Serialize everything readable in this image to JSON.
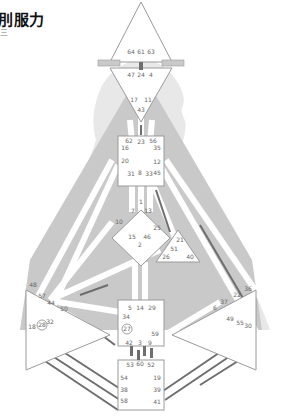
{
  "header": {
    "title": "刖服力",
    "subtitle": "三"
  },
  "colors": {
    "background": "#ffffff",
    "silhouette": "#e6e6e6",
    "body_fill": "#c9c9c9",
    "center_fill": "#ffffff",
    "center_stroke": "#9a9a9a",
    "channel_open": "#ffffff",
    "channel_defined": "#6e6e6e",
    "gate_text": "#666666"
  },
  "bodygraph": {
    "centers": [
      {
        "name": "Head",
        "gates": [
          "64",
          "61",
          "63"
        ]
      },
      {
        "name": "Ajna",
        "gates": [
          "47",
          "24",
          "4",
          "17",
          "11",
          "43"
        ]
      },
      {
        "name": "Throat",
        "gates": [
          "62",
          "23",
          "56",
          "16",
          "35",
          "20",
          "12",
          "31",
          "8",
          "33",
          "45"
        ]
      },
      {
        "name": "G",
        "gates": [
          "1",
          "7",
          "13",
          "10",
          "25",
          "15",
          "46",
          "2"
        ]
      },
      {
        "name": "Heart",
        "gates": [
          "21",
          "51",
          "26",
          "40"
        ]
      },
      {
        "name": "Spleen",
        "gates": [
          "48",
          "57",
          "44",
          "50",
          "32",
          "28",
          "18"
        ]
      },
      {
        "name": "Solar Plexus",
        "gates": [
          "36",
          "22",
          "37",
          "6",
          "49",
          "55",
          "30"
        ]
      },
      {
        "name": "Sacral",
        "gates": [
          "5",
          "14",
          "29",
          "34",
          "27",
          "59",
          "42",
          "3",
          "9"
        ]
      },
      {
        "name": "Root",
        "gates": [
          "53",
          "60",
          "52",
          "54",
          "19",
          "38",
          "39",
          "58",
          "41"
        ]
      }
    ],
    "circled_gates": [
      "27",
      "28"
    ],
    "gate_labels": {
      "g64": "64",
      "g61": "61",
      "g63": "63",
      "g47": "47",
      "g24": "24",
      "g4": "4",
      "g17": "17",
      "g11": "11",
      "g43": "43",
      "g62": "62",
      "g23": "23",
      "g56": "56",
      "g16": "16",
      "g35": "35",
      "g20": "20",
      "g12": "12",
      "g31": "31",
      "g8": "8",
      "g33": "33",
      "g45": "45",
      "g1": "1",
      "g7": "7",
      "g13": "13",
      "g10": "10",
      "g25": "25",
      "g15": "15",
      "g46": "46",
      "g2": "2",
      "g21": "21",
      "g51": "51",
      "g26": "26",
      "g40": "40",
      "g48": "48",
      "g57": "57",
      "g44": "44",
      "g50": "50",
      "g32": "32",
      "g28": "28",
      "g18": "18",
      "g36": "36",
      "g22": "22",
      "g37": "37",
      "g6": "6",
      "g49": "49",
      "g55": "55",
      "g30": "30",
      "g5": "5",
      "g14": "14",
      "g29": "29",
      "g34": "34",
      "g27": "27",
      "g59": "59",
      "g42": "42",
      "g3": "3",
      "g9": "9",
      "g53": "53",
      "g60": "60",
      "g52": "52",
      "g54": "54",
      "g19": "19",
      "g38": "38",
      "g39": "39",
      "g58": "58",
      "g41": "41"
    }
  }
}
